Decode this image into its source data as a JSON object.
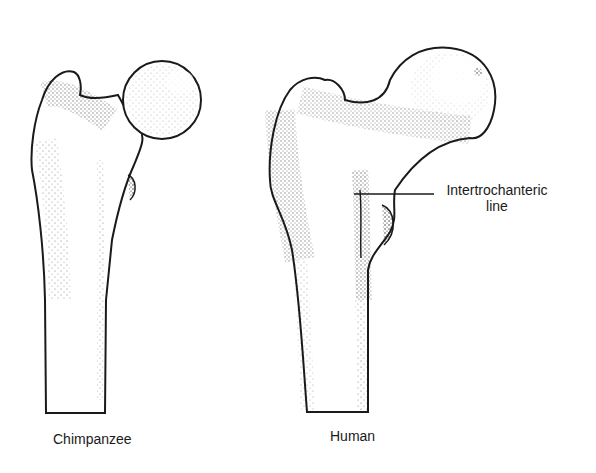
{
  "figure": {
    "specimens": [
      {
        "id": "chimpanzee",
        "label": "Chimpanzee"
      },
      {
        "id": "human",
        "label": "Human"
      }
    ],
    "annotations": [
      {
        "id": "intertrochanteric-line",
        "line1": "Intertrochanteric",
        "line2": "line",
        "target": "human"
      }
    ],
    "colors": {
      "ink": "#1a1a1a",
      "background": "#ffffff"
    }
  }
}
